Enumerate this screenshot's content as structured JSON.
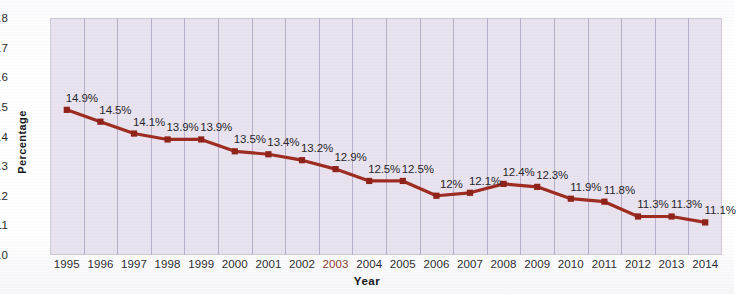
{
  "chart_data": {
    "type": "line",
    "title": "",
    "subtitle": "",
    "xlabel": "Year",
    "ylabel": "Percentage",
    "categories": [
      "1995",
      "1996",
      "1997",
      "1998",
      "1999",
      "2000",
      "2001",
      "2002",
      "2003",
      "2004",
      "2005",
      "2006",
      "2007",
      "2008",
      "2009",
      "2010",
      "2011",
      "2012",
      "2013",
      "2014"
    ],
    "values": [
      14.9,
      14.5,
      14.1,
      13.9,
      13.9,
      13.5,
      13.4,
      13.2,
      12.9,
      12.5,
      12.5,
      12.0,
      12.1,
      12.4,
      12.3,
      11.9,
      11.8,
      11.3,
      11.3,
      11.1
    ],
    "point_labels": [
      "14.9%",
      "14.5%",
      "14.1%",
      "13.9%",
      "13.9%",
      "13.5%",
      "13.4%",
      "13.2%",
      "12.9%",
      "12.5%",
      "12.5%",
      "12%",
      "12.1%",
      "12.4%",
      "12.3%",
      "11.9%",
      "11.8%",
      "11.3%",
      "11.3%",
      "11.1%"
    ],
    "ylim": [
      10,
      18
    ],
    "yticks": [
      "10",
      "11",
      "12",
      "13",
      "14",
      "15",
      "16",
      "17",
      "18"
    ],
    "xtick_highlight": "2003",
    "grid": "vertical",
    "legend": "none",
    "series": [
      {
        "name": "Percentage",
        "values": [
          14.9,
          14.5,
          14.1,
          13.9,
          13.9,
          13.5,
          13.4,
          13.2,
          12.9,
          12.5,
          12.5,
          12.0,
          12.1,
          12.4,
          12.3,
          11.9,
          11.8,
          11.3,
          11.3,
          11.1
        ]
      }
    ]
  },
  "style": {
    "line_color": "#9e2b20",
    "marker_color": "#8e2118",
    "plot_background": "#e9e3ef",
    "gridline_color": "#b9aec8",
    "page_background": "#ffffff",
    "label_color": "#26262a",
    "highlight_tick_color": "#8a3a2c"
  }
}
